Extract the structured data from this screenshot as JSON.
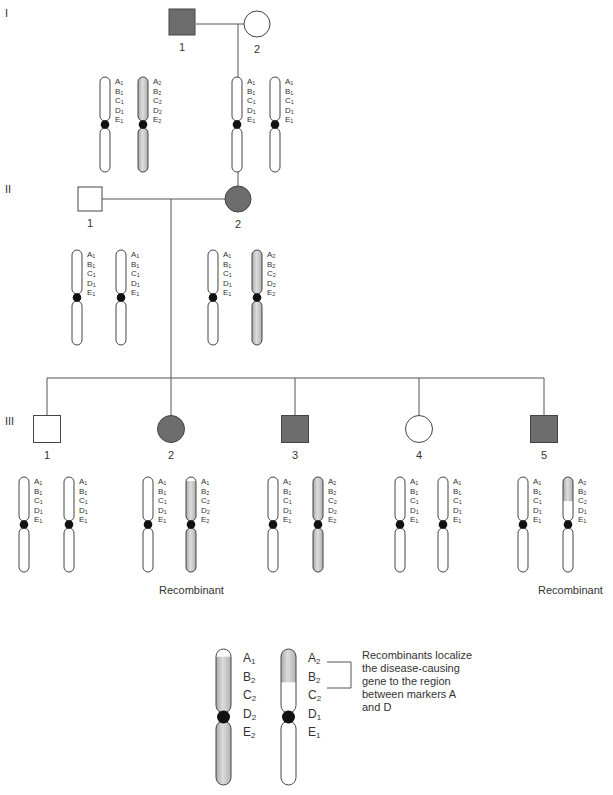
{
  "figure": {
    "type": "pedigree-linkage-diagram",
    "colors": {
      "affected_fill": "#6d6d6d",
      "unaffected_fill": "#ffffff",
      "outline": "#444444",
      "disease_chromosome": "#c8c8c8",
      "centromere": "#111111"
    },
    "generations": [
      {
        "label": "I",
        "individuals": [
          {
            "number": "1",
            "sex": "male",
            "affected": true,
            "chromosomes": [
              {
                "markers": [
                  "A1",
                  "B1",
                  "C1",
                  "D1",
                  "E1"
                ],
                "shaded": "none"
              },
              {
                "markers": [
                  "A2",
                  "B2",
                  "C2",
                  "D2",
                  "E2"
                ],
                "shaded": "full"
              }
            ]
          },
          {
            "number": "2",
            "sex": "female",
            "affected": false,
            "chromosomes": [
              {
                "markers": [
                  "A1",
                  "B1",
                  "C1",
                  "D1",
                  "E1"
                ],
                "shaded": "none"
              },
              {
                "markers": [
                  "A1",
                  "B1",
                  "C1",
                  "D1",
                  "E1"
                ],
                "shaded": "none"
              }
            ]
          }
        ]
      },
      {
        "label": "II",
        "individuals": [
          {
            "number": "1",
            "sex": "male",
            "affected": false,
            "chromosomes": [
              {
                "markers": [
                  "A1",
                  "B1",
                  "C1",
                  "D1",
                  "E1"
                ],
                "shaded": "none"
              },
              {
                "markers": [
                  "A1",
                  "B1",
                  "C1",
                  "D1",
                  "E1"
                ],
                "shaded": "none"
              }
            ]
          },
          {
            "number": "2",
            "sex": "female",
            "affected": true,
            "chromosomes": [
              {
                "markers": [
                  "A1",
                  "B1",
                  "C1",
                  "D1",
                  "E1"
                ],
                "shaded": "none"
              },
              {
                "markers": [
                  "A2",
                  "B2",
                  "C2",
                  "D2",
                  "E2"
                ],
                "shaded": "full"
              }
            ]
          }
        ]
      },
      {
        "label": "III",
        "individuals": [
          {
            "number": "1",
            "sex": "male",
            "affected": false,
            "chromosomes": [
              {
                "markers": [
                  "A1",
                  "B1",
                  "C1",
                  "D1",
                  "E1"
                ],
                "shaded": "none"
              },
              {
                "markers": [
                  "A1",
                  "B1",
                  "C1",
                  "D1",
                  "E1"
                ],
                "shaded": "none"
              }
            ]
          },
          {
            "number": "2",
            "sex": "female",
            "affected": true,
            "note": "Recombinant",
            "chromosomes": [
              {
                "markers": [
                  "A1",
                  "B1",
                  "C1",
                  "D1",
                  "E1"
                ],
                "shaded": "none"
              },
              {
                "markers": [
                  "A1",
                  "B2",
                  "C2",
                  "D2",
                  "E2"
                ],
                "shaded": "below-A"
              }
            ]
          },
          {
            "number": "3",
            "sex": "male",
            "affected": true,
            "chromosomes": [
              {
                "markers": [
                  "A1",
                  "B1",
                  "C1",
                  "D1",
                  "E1"
                ],
                "shaded": "none"
              },
              {
                "markers": [
                  "A2",
                  "B2",
                  "C2",
                  "D2",
                  "E2"
                ],
                "shaded": "full"
              }
            ]
          },
          {
            "number": "4",
            "sex": "female",
            "affected": false,
            "chromosomes": [
              {
                "markers": [
                  "A1",
                  "B1",
                  "C1",
                  "D1",
                  "E1"
                ],
                "shaded": "none"
              },
              {
                "markers": [
                  "A1",
                  "B1",
                  "C1",
                  "D1",
                  "E1"
                ],
                "shaded": "none"
              }
            ]
          },
          {
            "number": "5",
            "sex": "male",
            "affected": true,
            "note": "Recombinant",
            "chromosomes": [
              {
                "markers": [
                  "A1",
                  "B1",
                  "C1",
                  "D1",
                  "E1"
                ],
                "shaded": "none"
              },
              {
                "markers": [
                  "A2",
                  "B2",
                  "C2",
                  "D1",
                  "E1"
                ],
                "shaded": "above-D"
              }
            ]
          }
        ]
      }
    ],
    "recombinant_label": "Recombinant",
    "enlarged": {
      "left_markers": [
        "A1",
        "B2",
        "C2",
        "D2",
        "E2"
      ],
      "right_markers": [
        "A2",
        "B2",
        "C2",
        "D1",
        "E1"
      ],
      "annotation": [
        "Recombinants localize",
        "the disease-causing",
        "gene to the region",
        "between markers A",
        "and D"
      ]
    },
    "generation_labels": [
      "I",
      "II",
      "III"
    ]
  }
}
